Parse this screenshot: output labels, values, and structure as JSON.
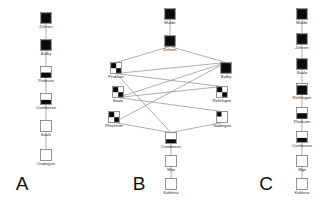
{
  "figure": {
    "title": "",
    "background": "#ffffff",
    "node_stroke": "#7a7a7a",
    "node_fill_color": "#0a0a0a",
    "edge_color": "#8d8d8d",
    "label_color": "#2b2b2b"
  },
  "panels": [
    {
      "letter": "A",
      "letter_x": 22,
      "letter_y": 190,
      "nodes": [
        {
          "id": "a1",
          "label": "Zehren",
          "x": 46,
          "y": 18,
          "fill_top": 0.0,
          "fill_bottom": 1.0,
          "fill_mode": "full"
        },
        {
          "id": "a2",
          "label": "Balby",
          "x": 46,
          "y": 45,
          "fill_top": 0.0,
          "fill_bottom": 1.0,
          "fill_mode": "full"
        },
        {
          "id": "a3",
          "label": "Probsen",
          "x": 46,
          "y": 72,
          "fill_top": 0.55,
          "fill_bottom": 1.0,
          "fill_mode": "band"
        },
        {
          "id": "a4",
          "label": "Cumbosen",
          "x": 46,
          "y": 99,
          "fill_top": 0.58,
          "fill_bottom": 0.95,
          "fill_mode": "band"
        },
        {
          "id": "a5",
          "label": "Saale",
          "x": 46,
          "y": 126,
          "fill_top": 0.0,
          "fill_bottom": 0.0,
          "fill_mode": "empty"
        },
        {
          "id": "a6",
          "label": "Oudingen",
          "x": 46,
          "y": 155,
          "fill_top": 0.0,
          "fill_bottom": 0.0,
          "fill_mode": "empty"
        }
      ],
      "edges": [
        {
          "from": "a1",
          "to": "a2"
        },
        {
          "from": "a2",
          "to": "a3"
        },
        {
          "from": "a3",
          "to": "a4"
        },
        {
          "from": "a4",
          "to": "a5"
        },
        {
          "from": "a5",
          "to": "a6"
        }
      ]
    },
    {
      "letter": "B",
      "letter_x": 139,
      "letter_y": 190,
      "nodes": [
        {
          "id": "b1",
          "label": "Mulde",
          "x": 170,
          "y": 14,
          "fill_top": 0.0,
          "fill_bottom": 1.0,
          "fill_mode": "full"
        },
        {
          "id": "b2",
          "label": "Zehren",
          "x": 170,
          "y": 41,
          "fill_top": 0.0,
          "fill_bottom": 1.0,
          "fill_mode": "full"
        },
        {
          "id": "b3",
          "label": "Probsen",
          "x": 116,
          "y": 68,
          "fill_top": 0.0,
          "fill_bottom": 1.0,
          "fill_mode": "corner"
        },
        {
          "id": "b4",
          "label": "Balby",
          "x": 226,
          "y": 68,
          "fill_top": 0.0,
          "fill_bottom": 1.0,
          "fill_mode": "full"
        },
        {
          "id": "b5",
          "label": "Saale",
          "x": 118,
          "y": 92,
          "fill_top": 0.0,
          "fill_bottom": 1.0,
          "fill_mode": "corner"
        },
        {
          "id": "b6",
          "label": "Rehlingen",
          "x": 222,
          "y": 92,
          "fill_top": 0.0,
          "fill_bottom": 1.0,
          "fill_mode": "corner"
        },
        {
          "id": "b7",
          "label": "Pfezheim",
          "x": 114,
          "y": 117,
          "fill_top": 0.0,
          "fill_bottom": 1.0,
          "fill_mode": "corner"
        },
        {
          "id": "b8",
          "label": "Gödingen",
          "x": 222,
          "y": 117,
          "fill_top": 0.0,
          "fill_bottom": 1.0,
          "fill_mode": "corner-sm"
        },
        {
          "id": "b9",
          "label": "Cumbosen",
          "x": 171,
          "y": 138,
          "fill_top": 0.62,
          "fill_bottom": 0.95,
          "fill_mode": "band"
        },
        {
          "id": "b10",
          "label": "Wipi",
          "x": 171,
          "y": 161,
          "fill_top": 0.0,
          "fill_bottom": 0.0,
          "fill_mode": "empty"
        },
        {
          "id": "b11",
          "label": "Koblenz",
          "x": 171,
          "y": 184,
          "fill_top": 0.0,
          "fill_bottom": 0.0,
          "fill_mode": "empty"
        }
      ],
      "edges": [
        {
          "from": "b1",
          "to": "b2"
        },
        {
          "from": "b2",
          "to": "b3"
        },
        {
          "from": "b2",
          "to": "b4"
        },
        {
          "from": "b3",
          "to": "b4"
        },
        {
          "from": "b3",
          "to": "b6"
        },
        {
          "from": "b3",
          "to": "b9"
        },
        {
          "from": "b5",
          "to": "b4"
        },
        {
          "from": "b5",
          "to": "b6"
        },
        {
          "from": "b5",
          "to": "b8"
        },
        {
          "from": "b7",
          "to": "b4"
        },
        {
          "from": "b7",
          "to": "b9"
        },
        {
          "from": "b8",
          "to": "b9"
        },
        {
          "from": "b9",
          "to": "b10"
        },
        {
          "from": "b10",
          "to": "b11"
        }
      ]
    },
    {
      "letter": "C",
      "letter_x": 266,
      "letter_y": 190,
      "nodes": [
        {
          "id": "c1",
          "label": "Mulde",
          "x": 302,
          "y": 14,
          "fill_top": 0.0,
          "fill_bottom": 1.0,
          "fill_mode": "full"
        },
        {
          "id": "c2",
          "label": "Zehren",
          "x": 302,
          "y": 39,
          "fill_top": 0.0,
          "fill_bottom": 1.0,
          "fill_mode": "full"
        },
        {
          "id": "c3",
          "label": "Saale",
          "x": 302,
          "y": 64,
          "fill_top": 0.0,
          "fill_bottom": 1.0,
          "fill_mode": "full"
        },
        {
          "id": "c4",
          "label": "Rehlingen",
          "x": 302,
          "y": 89,
          "fill_top": 0.18,
          "fill_bottom": 1.0,
          "fill_mode": "band"
        },
        {
          "id": "c5",
          "label": "Pfedsom",
          "x": 302,
          "y": 113,
          "fill_top": 0.52,
          "fill_bottom": 1.0,
          "fill_mode": "band"
        },
        {
          "id": "c6",
          "label": "Cumbosen",
          "x": 302,
          "y": 137,
          "fill_top": 0.58,
          "fill_bottom": 0.95,
          "fill_mode": "band"
        },
        {
          "id": "c7",
          "label": "Wipi",
          "x": 302,
          "y": 161,
          "fill_top": 0.0,
          "fill_bottom": 0.0,
          "fill_mode": "empty"
        },
        {
          "id": "c8",
          "label": "Koblenz",
          "x": 302,
          "y": 184,
          "fill_top": 0.0,
          "fill_bottom": 0.0,
          "fill_mode": "empty"
        }
      ],
      "edges": [
        {
          "from": "c1",
          "to": "c2"
        },
        {
          "from": "c2",
          "to": "c3"
        },
        {
          "from": "c3",
          "to": "c4"
        },
        {
          "from": "c4",
          "to": "c5"
        },
        {
          "from": "c5",
          "to": "c6"
        },
        {
          "from": "c6",
          "to": "c7"
        },
        {
          "from": "c7",
          "to": "c8"
        }
      ]
    }
  ],
  "node_size": 11,
  "label_offset_y": 10
}
